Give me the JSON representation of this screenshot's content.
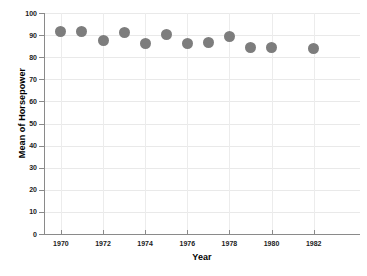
{
  "chart_data": {
    "type": "scatter",
    "title": "",
    "xlabel": "Year",
    "ylabel": "Mean of Horsepower",
    "xlim": [
      1969.2,
      1984.2
    ],
    "ylim": [
      0,
      100
    ],
    "grid": true,
    "legend": null,
    "marker_color": "#7d7d7d",
    "axis_color": "#8a8a8a",
    "grid_color": "#ececec",
    "x": [
      1970,
      1971,
      1972,
      1973,
      1974,
      1975,
      1976,
      1977,
      1978,
      1979,
      1980,
      1982
    ],
    "values": [
      91.5,
      91.5,
      87.5,
      91.0,
      86.0,
      90.5,
      86.0,
      86.5,
      89.5,
      84.5,
      84.5,
      84.0
    ],
    "points": [
      {
        "x": 1970,
        "y": 91.5
      },
      {
        "x": 1971,
        "y": 91.5
      },
      {
        "x": 1972,
        "y": 87.5
      },
      {
        "x": 1973,
        "y": 91.0
      },
      {
        "x": 1974,
        "y": 86.0
      },
      {
        "x": 1975,
        "y": 90.5
      },
      {
        "x": 1976,
        "y": 86.0
      },
      {
        "x": 1977,
        "y": 86.5
      },
      {
        "x": 1978,
        "y": 89.5
      },
      {
        "x": 1979,
        "y": 84.5
      },
      {
        "x": 1980,
        "y": 84.5
      },
      {
        "x": 1982,
        "y": 84.0
      }
    ],
    "yticks": [
      0,
      10,
      20,
      30,
      40,
      50,
      60,
      70,
      80,
      90,
      100
    ],
    "ytick_labels": [
      "0",
      "10",
      "20",
      "30",
      "40",
      "50",
      "60",
      "70",
      "80",
      "90",
      "100"
    ],
    "xticks": [
      1970,
      1972,
      1974,
      1976,
      1978,
      1980,
      1982
    ],
    "xtick_labels": [
      "1970",
      "1972",
      "1974",
      "1976",
      "1978",
      "1980",
      "1982"
    ]
  }
}
